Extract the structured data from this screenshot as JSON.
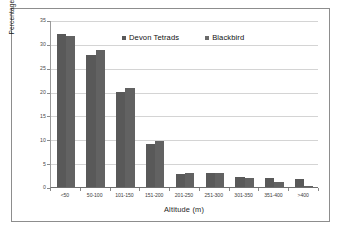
{
  "figure": {
    "background": "#ffffff",
    "border_color": "#8d8d8d"
  },
  "legend": {
    "position": "top-center",
    "entries": [
      {
        "label": "Devon Tetrads",
        "color": "#595959",
        "swatch": "square-marker"
      },
      {
        "label": "Blackbird",
        "color": "#6b6b6b",
        "swatch": "square-marker"
      }
    ]
  },
  "axes": {
    "x_title": "Altitude (m)",
    "y_title": "Percentage at each altitude",
    "y_ticks": [
      "0",
      "5",
      "10",
      "15",
      "20",
      "25",
      "30",
      "35"
    ]
  },
  "chart_data": {
    "type": "bar",
    "title": "",
    "subtitle": "",
    "xlabel": "Altitude (m)",
    "ylabel": "Percentage at each altitude",
    "categories": [
      "<50",
      "50-100",
      "101-150",
      "151-200",
      "201-250",
      "251-300",
      "301-350",
      "351-400",
      ">400"
    ],
    "series": [
      {
        "name": "Devon Tetrads",
        "color": "#595959",
        "values": [
          32.0,
          27.7,
          20.0,
          9.1,
          2.8,
          2.9,
          2.2,
          1.8,
          1.6
        ]
      },
      {
        "name": "Blackbird",
        "color": "#626262",
        "values": [
          31.7,
          28.8,
          20.7,
          9.6,
          3.0,
          2.9,
          1.9,
          1.1,
          0.2
        ]
      }
    ],
    "ylim": [
      0,
      35
    ],
    "ytick_step": 5,
    "grid": "horizontal",
    "legend_position": "top-center"
  }
}
